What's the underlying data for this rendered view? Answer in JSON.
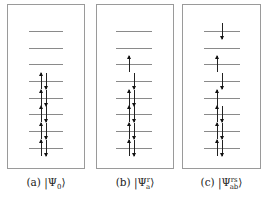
{
  "figure": {
    "type": "orbital-occupation-diagram",
    "levels_per_panel": 8,
    "panels": [
      {
        "id": "a",
        "caption_prefix": "(a)",
        "caption_state": "|Ψ",
        "caption_sub": "0",
        "caption_sup": "",
        "caption_close": "⟩",
        "description": "Ground-state reference determinant",
        "occupations": [
          "empty",
          "empty",
          "empty",
          "updown",
          "updown",
          "updown",
          "updown",
          "updown"
        ]
      },
      {
        "id": "b",
        "caption_prefix": "(b)",
        "caption_state": "|Ψ",
        "caption_sub": "a",
        "caption_sup": "r",
        "caption_close": "⟩",
        "description": "Singly excited determinant",
        "occupations": [
          "empty",
          "empty",
          "up",
          "down",
          "updown",
          "updown",
          "updown",
          "updown"
        ]
      },
      {
        "id": "c",
        "caption_prefix": "(c)",
        "caption_state": "|Ψ",
        "caption_sub": "ab",
        "caption_sup": "rs",
        "caption_close": "⟩",
        "description": "Doubly excited determinant",
        "occupations": [
          "down",
          "empty",
          "up",
          "down",
          "up",
          "updown",
          "updown",
          "updown"
        ]
      }
    ]
  },
  "colors": {
    "border": "#9a9a9a",
    "level": "#8a8a8a",
    "arrow": "#111111",
    "text": "#222222"
  }
}
